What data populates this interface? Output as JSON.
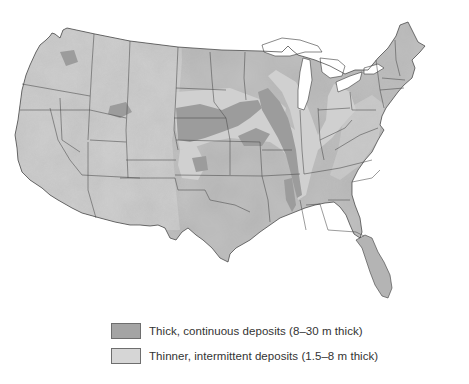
{
  "map": {
    "subject": "Loess deposits of the contiguous United States",
    "colors": {
      "background": "#ffffff",
      "land_base": "#b5b5b5",
      "land_relief_light": "#d8d8d8",
      "land_relief_dark": "#8f8f8f",
      "water_lakes": "#ffffff",
      "state_borders": "#4a4a4a",
      "thick_deposits": "#9a9a9a",
      "thin_deposits": "#cfcfcf"
    }
  },
  "legend": {
    "items": [
      {
        "label": "Thick, continuous deposits (8–30 m thick)",
        "swatch_color": "#a4a4a4"
      },
      {
        "label": "Thinner, intermittent deposits (1.5–8 m thick)",
        "swatch_color": "#d6d6d6"
      }
    ]
  }
}
